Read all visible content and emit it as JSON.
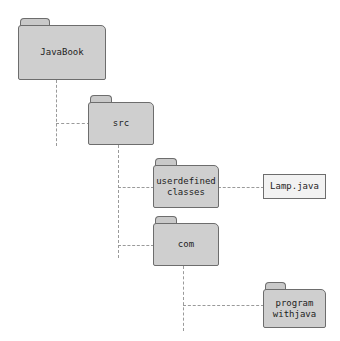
{
  "diagram": {
    "background_color": "#ffffff",
    "folder_fill": "#cfcfcf",
    "folder_border": "#6d6d6d",
    "file_fill": "#f2f2f2",
    "shadow_color": "#a8a8a8",
    "connector_color": "#9a9a9a",
    "nodes": [
      {
        "id": "javabook",
        "type": "folder",
        "label": "JavaBook"
      },
      {
        "id": "src",
        "type": "folder",
        "label": "src"
      },
      {
        "id": "userdefined",
        "type": "folder",
        "label": "userdefined\nclasses"
      },
      {
        "id": "lampjava",
        "type": "file",
        "label": "Lamp.java"
      },
      {
        "id": "com",
        "type": "folder",
        "label": "com"
      },
      {
        "id": "programwithjava",
        "type": "folder",
        "label": "program\nwithjava"
      }
    ]
  }
}
